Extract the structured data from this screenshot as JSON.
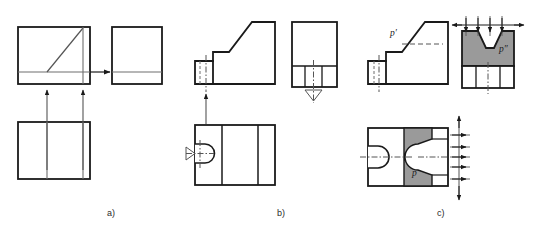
{
  "figure": {
    "type": "engineering-drawing",
    "background": "#ffffff",
    "line_color": "#1a1a1a",
    "thin_line_color": "#555555",
    "shade_color": "#9a9a9a",
    "captions": [
      {
        "id": "a",
        "label": "a)",
        "x": 107,
        "y": 208
      },
      {
        "id": "b",
        "label": "b)",
        "x": 277,
        "y": 208
      },
      {
        "id": "c",
        "label": "c)",
        "x": 437,
        "y": 208
      }
    ],
    "surface_labels": [
      {
        "name": "p-prime",
        "label": "p′",
        "x": 390,
        "y": 32,
        "style": "italic"
      },
      {
        "name": "p-double-prime",
        "label": "p″",
        "x": 499,
        "y": 48,
        "style": "italic"
      },
      {
        "name": "p-plain",
        "label": "p",
        "x": 412,
        "y": 172,
        "style": "italic"
      }
    ],
    "panels": [
      {
        "id": "a",
        "name": "panel-a-projection-of-inclined-plane",
        "views": [
          {
            "name": "front-view",
            "x": 18,
            "y": 27,
            "w": 72,
            "h": 57
          },
          {
            "name": "side-view",
            "x": 112,
            "y": 27,
            "w": 50,
            "h": 57
          },
          {
            "name": "top-view",
            "x": 18,
            "y": 122,
            "w": 72,
            "h": 57
          }
        ],
        "arrows": [
          {
            "name": "projection-arrow-horizontal",
            "direction": "right"
          },
          {
            "name": "projection-arrow-vertical-left",
            "direction": "up"
          },
          {
            "name": "projection-arrow-vertical-right",
            "direction": "up"
          }
        ]
      },
      {
        "id": "b",
        "name": "panel-b-projection-of-slot-feature",
        "views": [
          {
            "name": "front-view",
            "x": 195,
            "y": 22,
            "w": 80,
            "h": 62
          },
          {
            "name": "side-view",
            "x": 292,
            "y": 22,
            "w": 45,
            "h": 65
          },
          {
            "name": "top-view",
            "x": 195,
            "y": 125,
            "w": 80,
            "h": 60
          }
        ],
        "arrows": [
          {
            "name": "projection-arrow-vertical",
            "direction": "up"
          }
        ]
      },
      {
        "id": "c",
        "name": "panel-c-shaded-surface-projection",
        "views": [
          {
            "name": "front-view",
            "x": 368,
            "y": 22,
            "w": 80,
            "h": 62
          },
          {
            "name": "side-view",
            "x": 462,
            "y": 25,
            "w": 52,
            "h": 62
          },
          {
            "name": "top-view",
            "x": 368,
            "y": 128,
            "w": 80,
            "h": 58
          }
        ],
        "shaded_regions": [
          {
            "name": "shaded-side-view",
            "label": "p″"
          },
          {
            "name": "shaded-top-view",
            "label": "p"
          }
        ]
      }
    ]
  }
}
